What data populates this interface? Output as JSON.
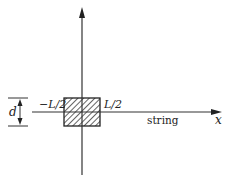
{
  "diagram": {
    "type": "physics-coordinate-sketch",
    "axes": {
      "horizontal": {
        "label": "x",
        "arrow": true
      },
      "vertical": {
        "label": "",
        "arrow": true
      }
    },
    "string_label": "string",
    "segment": {
      "left_label": "−L/2",
      "right_label": "L/2",
      "fill": "hatched"
    },
    "dimension": {
      "label": "d"
    },
    "colors": {
      "ink": "#222222",
      "background": "#ffffff"
    }
  }
}
